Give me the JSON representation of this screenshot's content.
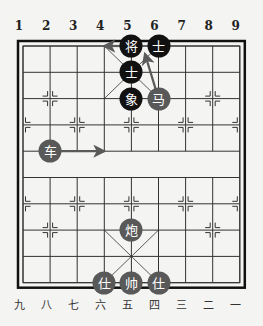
{
  "board": {
    "origin": {
      "x": 23,
      "y": 46
    },
    "step": {
      "x": 27.1,
      "y": 26.3
    },
    "colors": {
      "line": "#333333",
      "border": "#111111",
      "black_piece": "#111111",
      "red_piece": "#595959",
      "arrow": "#5a5a5a"
    }
  },
  "top_labels": [
    "1",
    "2",
    "3",
    "4",
    "5",
    "6",
    "7",
    "8",
    "9"
  ],
  "bottom_labels": [
    "九",
    "八",
    "七",
    "六",
    "五",
    "四",
    "三",
    "二",
    "一"
  ],
  "pieces": [
    {
      "char": "将",
      "side": "black",
      "col": 4,
      "row": 0
    },
    {
      "char": "士",
      "side": "black",
      "col": 5,
      "row": 0
    },
    {
      "char": "士",
      "side": "black",
      "col": 4,
      "row": 1
    },
    {
      "char": "象",
      "side": "black",
      "col": 4,
      "row": 2
    },
    {
      "char": "马",
      "side": "red",
      "col": 5,
      "row": 2
    },
    {
      "char": "车",
      "side": "red",
      "col": 1,
      "row": 4
    },
    {
      "char": "炮",
      "side": "red",
      "col": 4,
      "row": 7
    },
    {
      "char": "仕",
      "side": "red",
      "col": 3,
      "row": 9
    },
    {
      "char": "帅",
      "side": "red",
      "col": 4,
      "row": 9
    },
    {
      "char": "仕",
      "side": "red",
      "col": 5,
      "row": 9
    }
  ],
  "arrows": [
    {
      "from": [
        1,
        4
      ],
      "to": [
        3,
        4
      ]
    },
    {
      "from": [
        4,
        0
      ],
      "to": [
        3,
        0
      ]
    },
    {
      "from": [
        5,
        2
      ],
      "to": [
        4.5,
        0.3
      ]
    }
  ],
  "markers": [
    [
      1,
      2
    ],
    [
      7,
      2
    ],
    [
      0,
      3
    ],
    [
      2,
      3
    ],
    [
      4,
      3
    ],
    [
      6,
      3
    ],
    [
      8,
      3
    ],
    [
      0,
      6
    ],
    [
      2,
      6
    ],
    [
      4,
      6
    ],
    [
      6,
      6
    ],
    [
      8,
      6
    ],
    [
      1,
      7
    ],
    [
      7,
      7
    ]
  ]
}
